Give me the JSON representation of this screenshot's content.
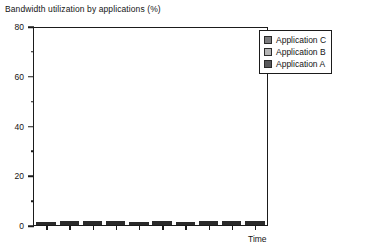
{
  "chart_data": {
    "type": "bar",
    "stacked": true,
    "title": "Bandwidth utilization by applications (%)",
    "xlabel": "Time",
    "ylabel": "",
    "ylim": [
      0,
      80
    ],
    "y_ticks_major": [
      0,
      20,
      40,
      60,
      80
    ],
    "y_ticks_minor": [
      10,
      30,
      50,
      70
    ],
    "grid": false,
    "legend_position": "top-right",
    "categories": [
      "1",
      "2",
      "3",
      "4",
      "5",
      "6",
      "7",
      "8",
      "9",
      "10"
    ],
    "series": [
      {
        "name": "Application A",
        "color": "#58585a",
        "values": [
          30,
          10,
          18,
          18,
          10,
          10,
          5,
          20,
          10,
          20
        ]
      },
      {
        "name": "Application B",
        "color": "#b4b4b4",
        "values": [
          10,
          20,
          22,
          16,
          9,
          9,
          8,
          7,
          30,
          10
        ]
      },
      {
        "name": "Application C",
        "color": "#7c7c7e",
        "values": [
          0,
          10,
          30,
          16,
          0,
          10,
          0,
          6,
          10,
          40
        ]
      }
    ],
    "totals": [
      40,
      40,
      70,
      50,
      19,
      29,
      13,
      33,
      50,
      70
    ],
    "legend_order": [
      "Application C",
      "Application B",
      "Application A"
    ]
  },
  "axes": {
    "y_tick_labels": [
      "80",
      "60",
      "40",
      "20",
      "0"
    ],
    "x_label": "Time"
  }
}
